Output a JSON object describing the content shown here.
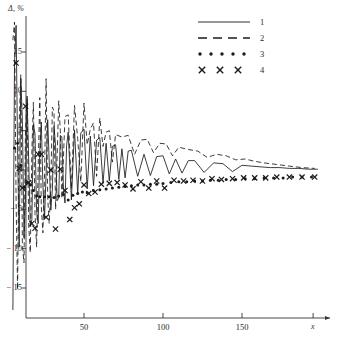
{
  "chart_data": {
    "type": "line",
    "title": "",
    "subtitle": "",
    "xlabel": "x",
    "ylabel": "Δ, %",
    "xlim": [
      0,
      200
    ],
    "ylim": [
      -18,
      19
    ],
    "grid": false,
    "legend_position": "top-right",
    "x_ticks": [
      50,
      100,
      150
    ],
    "y_ticks": [
      15,
      10,
      5,
      0,
      -5,
      -10,
      -15
    ],
    "x_tick_labels": [
      "50",
      "100",
      "150"
    ],
    "y_tick_labels": [
      "15",
      "10",
      "5",
      "0",
      "− 5",
      "− 10",
      "− 15"
    ],
    "annotations": [],
    "series": [
      {
        "name": "1",
        "style": "solid-line",
        "x": [
          5,
          6,
          7,
          8,
          9,
          10,
          11,
          12,
          13,
          14,
          15,
          16,
          17,
          18,
          19,
          20,
          21,
          22,
          23,
          24,
          25,
          26,
          27,
          28,
          29,
          30,
          31,
          32,
          33,
          34,
          35,
          36,
          37,
          38,
          39,
          40,
          42,
          44,
          46,
          48,
          50,
          52,
          54,
          56,
          58,
          60,
          62,
          64,
          66,
          68,
          70,
          72,
          74,
          76,
          78,
          80,
          84,
          88,
          92,
          96,
          100,
          104,
          108,
          112,
          116,
          120,
          126,
          132,
          138,
          144,
          150,
          156,
          162,
          168,
          174,
          180,
          186,
          192,
          198
        ],
        "values": [
          -17.8,
          13.5,
          18.4,
          2.5,
          -9.8,
          11.6,
          6.2,
          -8.6,
          -3.1,
          9.4,
          1.2,
          -7.2,
          -6.3,
          5.8,
          4.6,
          -5.2,
          -6.8,
          2.4,
          6.1,
          -1.9,
          -6.2,
          -0.5,
          6.4,
          1.1,
          -5.1,
          -2.4,
          5.6,
          3.0,
          -3.9,
          -3.6,
          4.4,
          4.2,
          -2.6,
          -4.2,
          3.1,
          4.8,
          -3.8,
          5.1,
          -3.0,
          4.7,
          5.2,
          -2.4,
          4.3,
          -2.0,
          3.8,
          4.1,
          -1.7,
          3.4,
          -1.4,
          3.0,
          3.2,
          -1.2,
          2.7,
          -1.0,
          2.4,
          2.5,
          -0.8,
          2.0,
          -0.7,
          1.7,
          1.8,
          -0.5,
          1.4,
          -0.4,
          1.2,
          1.2,
          -0.3,
          0.9,
          0.8,
          -0.2,
          0.6,
          0.5,
          0.4,
          0.3,
          0.3,
          0.2,
          0.2,
          0.1,
          0.1
        ]
      },
      {
        "name": "2",
        "style": "dashed-line",
        "x": [
          5,
          6,
          7,
          8,
          9,
          10,
          11,
          12,
          13,
          14,
          15,
          16,
          17,
          18,
          19,
          20,
          21,
          22,
          23,
          24,
          25,
          26,
          27,
          28,
          29,
          30,
          31,
          32,
          33,
          34,
          35,
          36,
          38,
          40,
          42,
          44,
          46,
          48,
          50,
          52,
          54,
          56,
          58,
          60,
          62,
          64,
          66,
          68,
          70,
          74,
          78,
          82,
          86,
          90,
          94,
          98,
          102,
          106,
          110,
          116,
          122,
          128,
          134,
          140,
          146,
          152,
          158,
          164,
          172,
          180,
          188,
          196
        ],
        "values": [
          16.5,
          18.8,
          -4.0,
          -15.2,
          6.0,
          12.1,
          -9.5,
          -11.8,
          5.0,
          9.0,
          -7.0,
          -10.5,
          2.5,
          8.6,
          -5.5,
          -9.8,
          0.5,
          9.2,
          -4.6,
          -8.0,
          -1.0,
          11.6,
          -3.5,
          -6.8,
          -2.0,
          8.0,
          7.5,
          -5.0,
          1.5,
          8.8,
          5.0,
          -3.6,
          6.8,
          7.0,
          -2.4,
          8.2,
          4.0,
          -1.5,
          8.5,
          3.2,
          5.2,
          6.0,
          -0.8,
          6.6,
          3.0,
          4.8,
          5.0,
          1.0,
          4.5,
          4.2,
          4.4,
          2.0,
          3.8,
          3.9,
          2.2,
          3.4,
          3.3,
          1.8,
          2.9,
          2.6,
          2.4,
          1.6,
          2.0,
          1.8,
          1.3,
          1.4,
          1.1,
          0.9,
          0.7,
          0.5,
          0.3,
          0.2
        ]
      },
      {
        "name": "3",
        "style": "dotted-markers",
        "x": [
          6,
          8,
          10,
          12,
          14,
          16,
          18,
          20,
          22,
          25,
          28,
          31,
          34,
          37,
          40,
          43,
          46,
          49,
          52,
          56,
          60,
          64,
          68,
          72,
          76,
          80,
          84,
          88,
          92,
          96,
          100,
          105,
          110,
          115,
          120,
          125,
          130,
          135,
          140,
          146,
          152,
          158,
          164,
          170,
          176,
          182,
          188,
          194
        ],
        "values": [
          2.8,
          3.4,
          0.6,
          -2.2,
          -1.6,
          -1.9,
          -2.6,
          -3.3,
          -3.4,
          -3.4,
          -3.4,
          -3.5,
          -3.3,
          -3.1,
          -3.8,
          -3.2,
          -3.0,
          -2.8,
          -2.9,
          -2.6,
          -2.5,
          -2.4,
          -2.3,
          -2.2,
          -2.1,
          -2.0,
          -1.9,
          -1.9,
          -1.8,
          -1.8,
          -1.7,
          -1.6,
          -1.5,
          -1.5,
          -1.4,
          -1.4,
          -1.3,
          -1.3,
          -1.2,
          -1.2,
          -1.1,
          -1.1,
          -1.0,
          -1.0,
          -1.0,
          -0.9,
          -0.9,
          -0.9
        ]
      },
      {
        "name": "4",
        "style": "x-markers",
        "x": [
          7,
          9,
          11,
          13,
          15,
          17,
          19,
          21,
          23,
          26,
          29,
          32,
          35,
          38,
          41,
          44,
          47,
          50,
          53,
          57,
          61,
          66,
          71,
          76,
          81,
          86,
          91,
          96,
          101,
          107,
          113,
          119,
          125,
          131,
          137,
          144,
          151,
          158,
          165,
          172,
          180,
          188,
          196
        ],
        "values": [
          13.6,
          0.2,
          -2.3,
          8.1,
          -1.6,
          -6.8,
          -7.4,
          2.0,
          2.0,
          -6.0,
          0.0,
          -7.5,
          0.1,
          -2.6,
          -6.3,
          -4.8,
          -4.3,
          -1.9,
          -3.0,
          -2.8,
          -1.8,
          -1.7,
          -1.6,
          -1.9,
          -2.4,
          -1.5,
          -2.3,
          -1.4,
          -2.3,
          -1.3,
          -1.4,
          -1.3,
          -1.4,
          -1.1,
          -1.2,
          -1.1,
          -1.0,
          -1.0,
          -1.0,
          -0.9,
          -0.9,
          -0.9,
          -0.9
        ]
      }
    ]
  },
  "axes": {
    "y_title": "Δ, %",
    "x_title": "x"
  },
  "legend": {
    "items": [
      {
        "label": "1",
        "style": "solid-line"
      },
      {
        "label": "2",
        "style": "dashed-line"
      },
      {
        "label": "3",
        "style": "dotted-markers"
      },
      {
        "label": "4",
        "style": "x-markers"
      }
    ]
  },
  "colors": {
    "ink": "#1a1a1a",
    "axis": "#333333",
    "background": "#ffffff"
  }
}
